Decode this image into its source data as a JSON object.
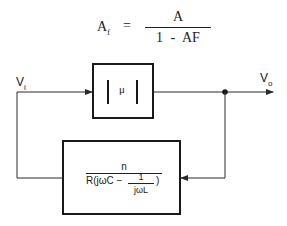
{
  "equation": {
    "lhs": "A",
    "lhs_subscript": "f",
    "equals": "=",
    "numerator": "A",
    "denominator": "1  -  AF"
  },
  "forward_block": {
    "label": "μ",
    "description": "magnitude bars |μ|"
  },
  "feedback_block": {
    "numerator": "n",
    "denominator_prefix": "R(jωC −",
    "inner_numerator": "1",
    "inner_denominator": "jωL",
    "denominator_suffix": ")"
  },
  "signals": {
    "input": "V",
    "input_subscript": "i",
    "output": "V",
    "output_subscript": "o"
  },
  "colors": {
    "line": "#2a2a2a",
    "background": "#ffffff"
  }
}
